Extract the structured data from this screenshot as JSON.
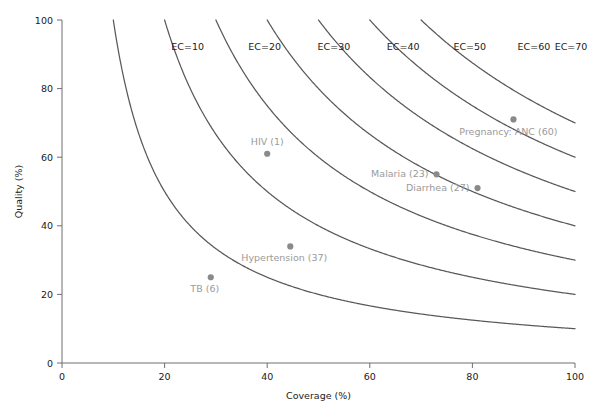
{
  "chart_data": {
    "type": "scatter",
    "title": "",
    "xlabel": "Coverage (%)",
    "ylabel": "Quality (%)",
    "xlim": [
      0,
      100
    ],
    "ylim": [
      0,
      100
    ],
    "xticks": [
      0,
      20,
      40,
      60,
      80,
      100
    ],
    "yticks": [
      0,
      20,
      40,
      60,
      80,
      100
    ],
    "xtick_labels": [
      "0",
      "20",
      "40",
      "60",
      "80",
      "100"
    ],
    "ytick_labels": [
      "0",
      "20",
      "40",
      "60",
      "80",
      "100"
    ],
    "grid": false,
    "legend": "none",
    "points": [
      {
        "label": "TB (6)",
        "x": 29.0,
        "y": 25.0,
        "label_dx": -6,
        "label_dy": 15,
        "anchor": "middle"
      },
      {
        "label": "HIV (1)",
        "x": 40.0,
        "y": 61.0,
        "label_dx": 0,
        "label_dy": -9,
        "anchor": "middle"
      },
      {
        "label": "Hypertension (37)",
        "x": 44.5,
        "y": 34.0,
        "label_dx": -6,
        "label_dy": 15,
        "anchor": "middle"
      },
      {
        "label": "Malaria (23)",
        "x": 73.0,
        "y": 55.0,
        "label_dx": -8,
        "label_dy": 3,
        "anchor": "end"
      },
      {
        "label": "Diarrhea (27)",
        "x": 81.0,
        "y": 51.0,
        "label_dx": -8,
        "label_dy": 3,
        "anchor": "end"
      },
      {
        "label": "Pregnancy: ANC (60)",
        "x": 88.0,
        "y": 71.0,
        "label_dx": -5,
        "label_dy": 16,
        "anchor": "middle"
      }
    ],
    "ec_curves": [
      {
        "label": "EC=10",
        "value": 10,
        "label_x": 24.5,
        "label_y": 92.0
      },
      {
        "label": "EC=20",
        "value": 20,
        "label_x": 39.5,
        "label_y": 92.0
      },
      {
        "label": "EC=30",
        "value": 30,
        "label_x": 53.0,
        "label_y": 92.0
      },
      {
        "label": "EC=40",
        "value": 40,
        "label_x": 66.5,
        "label_y": 92.0
      },
      {
        "label": "EC=50",
        "value": 50,
        "label_x": 79.5,
        "label_y": 92.0
      },
      {
        "label": "EC=60",
        "value": 60,
        "label_x": 92.0,
        "label_y": 92.0
      },
      {
        "label": "EC=70",
        "value": 70,
        "label_x": 105.0,
        "label_y": 92.0
      }
    ],
    "colors": {
      "curve": "#595959",
      "point": "#8a8a8a",
      "point_label": "#9a9a9a",
      "axis": "#6e6e6e",
      "tick_text": "#1a1a1a",
      "background": "#ffffff"
    }
  }
}
